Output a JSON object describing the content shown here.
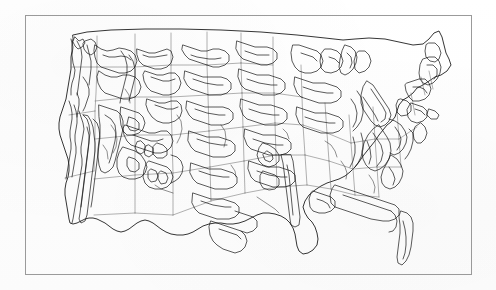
{
  "figure": {
    "kind": "map",
    "title": "",
    "caption": "",
    "rendering": "scanned black-and-white line drawing",
    "background_color": "#fefefe",
    "frame": {
      "visible": true,
      "color": "#9a9a9a",
      "line_width_px": 1,
      "x": 25,
      "y": 15,
      "width": 447,
      "height": 260
    },
    "has_text_labels": false,
    "has_legend": false,
    "has_scale_bar": false,
    "has_north_arrow": false,
    "has_graticule": false
  },
  "map": {
    "projection_appearance": "conic (Albers-like), curved northern border",
    "extent": "contiguous 48 states (CONUS)",
    "layers": [
      {
        "name": "state-boundaries",
        "stroke_color": "#6f6f6f",
        "stroke_width": 0.55,
        "description": "thin light gray state outlines"
      },
      {
        "name": "ecoregion-boundaries",
        "stroke_color": "#1a1a1a",
        "stroke_width": 0.72,
        "description": "dark irregular ecoregion polygon outlines"
      },
      {
        "name": "coastline",
        "stroke_color": "#111111",
        "stroke_width": 0.85,
        "description": "national outline including Pacific, Atlantic and Gulf coasts"
      }
    ],
    "recognizable_features": [
      "Pacific coastline of California, Oregon, Washington",
      "California Central Valley enclosed by coastal and Sierra ranges",
      "Puget Sound / Olympic Peninsula",
      "Rocky Mountain ranges through Idaho, Montana, Wyoming, Colorado",
      "Four Corners region",
      "Great Plains of the Dakotas, Nebraska, Kansas",
      "Great Lakes: Superior, Michigan, Huron, Erie, Ontario",
      "Michigan Upper and Lower Peninsulas",
      "Mississippi Alluvial Plain",
      "Appalachian ridge-and-valley belt",
      "Florida peninsula",
      "Gulf Coast of Texas and Louisiana",
      "Maine and New England",
      "Long Island and Chesapeake Bay"
    ]
  },
  "colors": {
    "paper": "#fefefe",
    "frame": "#9a9a9a",
    "state_line": "#6f6f6f",
    "ecoregion_line": "#1a1a1a",
    "coast_line": "#111111"
  }
}
